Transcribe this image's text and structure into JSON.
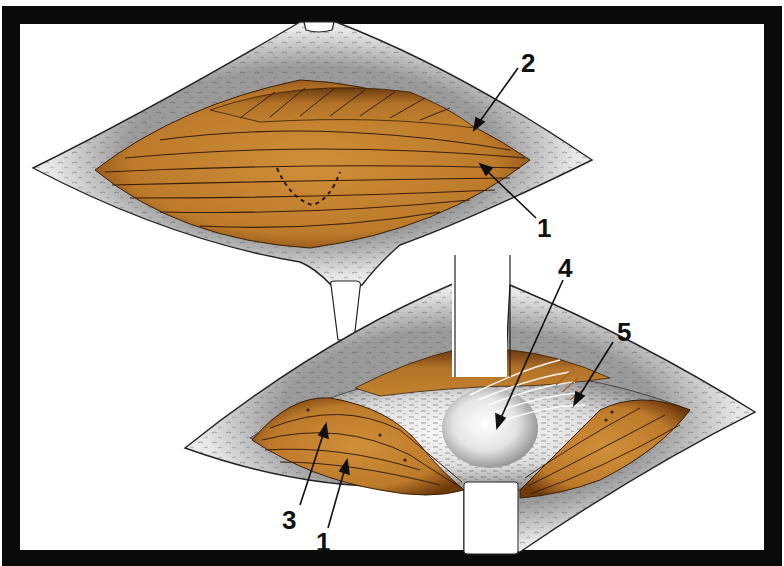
{
  "figure": {
    "frame_color": "#0a0a0a",
    "background": "#ffffff",
    "muscle_color": "#c4832f",
    "muscle_dark": "#7a4512",
    "fiber_color": "#3a1e08",
    "skin_color": "#efefef",
    "fascia_color": "#d9d9d9",
    "panels": [
      {
        "name": "upper-incision",
        "labels": [
          {
            "id": "label-2",
            "text": "2"
          },
          {
            "id": "label-1-top",
            "text": "1"
          }
        ]
      },
      {
        "name": "lower-incision",
        "labels": [
          {
            "id": "label-4",
            "text": "4"
          },
          {
            "id": "label-5",
            "text": "5"
          },
          {
            "id": "label-3",
            "text": "3"
          },
          {
            "id": "label-1-bottom",
            "text": "1"
          }
        ]
      }
    ]
  },
  "labels": {
    "l2": "2",
    "l1_top": "1",
    "l4": "4",
    "l5": "5",
    "l3": "3",
    "l1_bottom": "1"
  }
}
